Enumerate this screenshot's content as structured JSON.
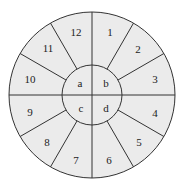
{
  "diagram": {
    "fill_color": "#ebebeb",
    "line_color": "#333333",
    "background": "#ffffff",
    "outer_sectors": [
      {
        "label": "1",
        "x": 110,
        "y": 32
      },
      {
        "label": "2",
        "x": 138,
        "y": 49
      },
      {
        "label": "3",
        "x": 155,
        "y": 79
      },
      {
        "label": "4",
        "x": 155,
        "y": 113
      },
      {
        "label": "5",
        "x": 139,
        "y": 142
      },
      {
        "label": "6",
        "x": 109,
        "y": 160
      },
      {
        "label": "7",
        "x": 76,
        "y": 160
      },
      {
        "label": "8",
        "x": 47,
        "y": 142
      },
      {
        "label": "9",
        "x": 30,
        "y": 112
      },
      {
        "label": "10",
        "x": 30,
        "y": 79
      },
      {
        "label": "11",
        "x": 48,
        "y": 48
      },
      {
        "label": "12",
        "x": 76,
        "y": 32
      }
    ],
    "inner_quadrants": [
      {
        "label": "a",
        "x": 80,
        "y": 83
      },
      {
        "label": "b",
        "x": 106,
        "y": 83
      },
      {
        "label": "c",
        "x": 81,
        "y": 108
      },
      {
        "label": "d",
        "x": 106,
        "y": 108
      }
    ]
  }
}
